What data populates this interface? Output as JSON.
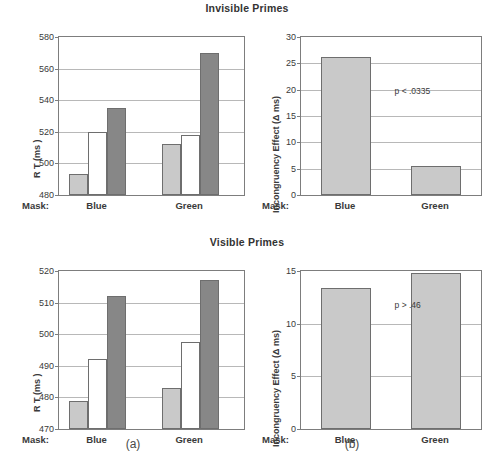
{
  "figure": {
    "captions": [
      {
        "text": "(a)",
        "x": 133
      },
      {
        "text": "(b)",
        "x": 352
      }
    ]
  },
  "rows": [
    {
      "title": "Invisible Primes"
    },
    {
      "title": "Visible Primes"
    }
  ],
  "axis": {
    "mask_label": "Mask:",
    "group_blue": "Blue",
    "group_green": "Green"
  },
  "chart_data": [
    {
      "id": "invisible-rt",
      "type": "bar",
      "title": "Invisible Primes",
      "panel": "a",
      "xlabel": "Mask:",
      "ylabel": "R T (ms )",
      "ylim": [
        480,
        580
      ],
      "yticks": [
        480,
        500,
        520,
        540,
        560,
        580
      ],
      "grid": true,
      "legend": "none",
      "categories": [
        "Blue",
        "Green"
      ],
      "series": [
        {
          "name": "light",
          "fill": "#c9c9c9",
          "values": [
            493,
            512
          ]
        },
        {
          "name": "white",
          "fill": "#ffffff",
          "values": [
            520,
            518
          ]
        },
        {
          "name": "dark",
          "fill": "#878787",
          "values": [
            535,
            570
          ]
        }
      ],
      "annotations": []
    },
    {
      "id": "invisible-incongruency",
      "type": "bar",
      "title": "Invisible Primes",
      "panel": "b",
      "xlabel": "Mask:",
      "ylabel": "Incongruency Effect (Δ ms)",
      "ylim": [
        0,
        30
      ],
      "yticks": [
        0,
        5,
        10,
        15,
        20,
        25,
        30
      ],
      "grid": true,
      "legend": "none",
      "categories": [
        "Blue",
        "Green"
      ],
      "values": [
        26.3,
        5.6
      ],
      "fill": "#c9c9c9",
      "annotations": [
        {
          "text": "p < .0335",
          "x_frac": 0.52,
          "y_value": 19.5
        }
      ]
    },
    {
      "id": "visible-rt",
      "type": "bar",
      "title": "Visible Primes",
      "panel": "a",
      "xlabel": "Mask:",
      "ylabel": "R T (ms )",
      "ylim": [
        470,
        520
      ],
      "yticks": [
        470,
        480,
        490,
        500,
        510,
        520
      ],
      "grid": true,
      "legend": "none",
      "categories": [
        "Blue",
        "Green"
      ],
      "series": [
        {
          "name": "light",
          "fill": "#c9c9c9",
          "values": [
            478.8,
            483.0
          ]
        },
        {
          "name": "white",
          "fill": "#ffffff",
          "values": [
            492.3,
            497.6
          ]
        },
        {
          "name": "dark",
          "fill": "#878787",
          "values": [
            512.2,
            517.3
          ]
        }
      ],
      "annotations": []
    },
    {
      "id": "visible-incongruency",
      "type": "bar",
      "title": "Visible Primes",
      "panel": "b",
      "xlabel": "Mask:",
      "ylabel": "Incongruency Effect (Δ ms)",
      "ylim": [
        0,
        15
      ],
      "yticks": [
        0,
        5,
        10,
        15
      ],
      "grid": true,
      "legend": "none",
      "categories": [
        "Blue",
        "Green"
      ],
      "values": [
        13.4,
        14.8
      ],
      "fill": "#c9c9c9",
      "annotations": [
        {
          "text": "p > .46",
          "x_frac": 0.52,
          "y_value": 11.7
        }
      ]
    }
  ]
}
